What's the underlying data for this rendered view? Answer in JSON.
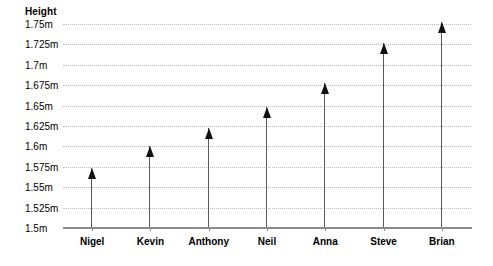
{
  "chart_data": {
    "type": "bar",
    "title": "",
    "ylabel": "Height",
    "xlabel": "",
    "categories": [
      "Nigel",
      "Kevin",
      "Anthony",
      "Neil",
      "Anna",
      "Steve",
      "Brian"
    ],
    "values": [
      1.573,
      1.6,
      1.623,
      1.648,
      1.678,
      1.727,
      1.752
    ],
    "ylim": [
      1.5,
      1.75
    ],
    "ytick_values": [
      1.5,
      1.525,
      1.55,
      1.575,
      1.6,
      1.625,
      1.65,
      1.675,
      1.7,
      1.725,
      1.75
    ],
    "ytick_labels": [
      "1.5m",
      "1.525m",
      "1.55m",
      "1.575m",
      "1.6m",
      "1.625m",
      "1.65m",
      "1.675m",
      "1.7m",
      "1.725m",
      "1.75m"
    ],
    "grid": true,
    "legend": false,
    "series": [
      {
        "name": "Height",
        "values": [
          1.573,
          1.6,
          1.623,
          1.648,
          1.678,
          1.727,
          1.752
        ]
      }
    ],
    "marker_style": "arrow",
    "colors": {
      "arrow_head": "#111111",
      "arrow_shaft": "#5a5a5a",
      "gridline": "#b8b8b8",
      "axis": "#8a8a8a",
      "text": "#000000",
      "background": "#ffffff"
    }
  }
}
